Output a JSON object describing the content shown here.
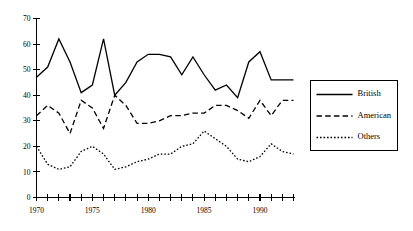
{
  "chart_data": {
    "type": "line",
    "title": "",
    "xlabel": "",
    "ylabel": "",
    "xlim": [
      1970,
      1993
    ],
    "ylim": [
      0,
      70
    ],
    "grid": false,
    "legend_position": "right",
    "x": [
      1970,
      1971,
      1972,
      1973,
      1974,
      1975,
      1976,
      1977,
      1978,
      1979,
      1980,
      1981,
      1982,
      1983,
      1984,
      1985,
      1986,
      1987,
      1988,
      1989,
      1990,
      1991,
      1992,
      1993
    ],
    "xticklabels": [
      "1970",
      "1975",
      "1980",
      "1985",
      "1990"
    ],
    "xtickvalues": [
      1970,
      1975,
      1980,
      1985,
      1990
    ],
    "yticklabels": [
      "0",
      "10",
      "20",
      "30",
      "40",
      "50",
      "60",
      "70"
    ],
    "ytickvalues": [
      0,
      10,
      20,
      30,
      40,
      50,
      60,
      70
    ],
    "series": [
      {
        "name": "British",
        "style": "solid",
        "values": [
          47,
          51,
          62,
          53,
          41,
          44,
          62,
          40,
          45,
          53,
          56,
          56,
          55,
          48,
          55,
          48,
          42,
          44,
          39,
          53,
          57,
          46,
          46,
          46
        ]
      },
      {
        "name": "American",
        "style": "dashed",
        "values": [
          32,
          36,
          33,
          25,
          38,
          35,
          27,
          40,
          36,
          29,
          29,
          30,
          32,
          32,
          33,
          33,
          36,
          36,
          34,
          31,
          38,
          32,
          38,
          38
        ]
      },
      {
        "name": "Others",
        "style": "dotted",
        "values": [
          20,
          13,
          11,
          12,
          18,
          20,
          17,
          11,
          12,
          14,
          15,
          17,
          17,
          20,
          21,
          26,
          23,
          20,
          15,
          14,
          16,
          21,
          18,
          17
        ]
      }
    ]
  },
  "legend": {
    "items": [
      {
        "label": "British"
      },
      {
        "label": "American"
      },
      {
        "label": "Others"
      }
    ]
  }
}
